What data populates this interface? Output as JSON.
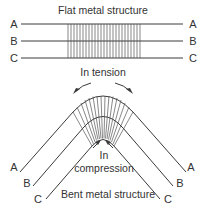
{
  "flat": {
    "title": "Flat metal structure",
    "labels_left": [
      "A",
      "B",
      "C"
    ],
    "labels_right": [
      "A",
      "B",
      "C"
    ]
  },
  "bent": {
    "tension_label": "In tension",
    "compression_label_1": "In",
    "compression_label_2": "compression",
    "title": "Bent metal structure",
    "labels_left": [
      "A",
      "B",
      "C"
    ],
    "labels_right": [
      "A",
      "B",
      "C"
    ]
  },
  "colors": {
    "line": "#3a3a3a",
    "text": "#333333"
  }
}
